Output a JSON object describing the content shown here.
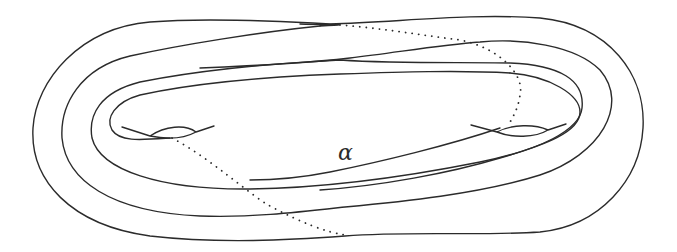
{
  "figure": {
    "type": "topological surface diagram",
    "labels": {
      "alpha": "α"
    },
    "colors": {
      "stroke": "#2b2b2b",
      "background": "#ffffff"
    }
  }
}
